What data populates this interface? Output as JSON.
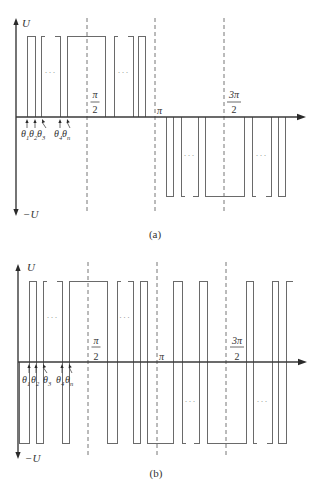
{
  "figure": {
    "panels": [
      {
        "id": "a",
        "caption": "(a)",
        "caption_pos": [
          155,
          238
        ],
        "waveform_type": "unipolar",
        "origin": {
          "x": 16,
          "y": 117
        },
        "levels": {
          "high": 36,
          "low": 196
        },
        "dots_y": {
          "high": 75,
          "low": 158
        },
        "dots_text": "···",
        "y_axis": {
          "top": 18,
          "bottom": 216,
          "pos_label": "U",
          "neg_label": "−U",
          "pos_label_pos": [
            22,
            27
          ],
          "neg_label_pos": [
            23,
            218
          ]
        },
        "x_axis": {
          "end": 306
        },
        "guides": {
          "x": [
            87,
            155,
            224
          ],
          "y_range": [
            18,
            214
          ]
        },
        "ticks": [
          {
            "kind": "fraction",
            "num": "π",
            "den": "2",
            "x": 95,
            "bar_y": 102,
            "num_y": 98,
            "den_y": 113,
            "half_width": 4.5
          },
          {
            "kind": "plain",
            "text": "π",
            "x": 157,
            "y": 114
          },
          {
            "kind": "fraction",
            "num": "3π",
            "den": "2",
            "x": 234,
            "bar_y": 102,
            "num_y": 98,
            "den_y": 113,
            "half_width": 7
          }
        ],
        "angles": {
          "label_y": 137,
          "tip_y": 119,
          "tail_y": 128,
          "items": [
            {
              "sym": "θ",
              "sub": "1",
              "x": 21,
              "tip": 27,
              "tail": 27
            },
            {
              "sym": "θ",
              "sub": "2",
              "x": 29,
              "tip": 35,
              "tail": 35
            },
            {
              "sym": "θ",
              "sub": "3",
              "x": 37,
              "tip": 42,
              "tail": 46
            },
            {
              "sym": "θ",
              "sub": "4",
              "x": 54,
              "tip": 60,
              "tail": 60
            },
            {
              "sym": "θ",
              "sub": "n",
              "x": 62,
              "tip": 67,
              "tail": 70
            }
          ]
        },
        "pulses": [
          {
            "x1": 27,
            "x2": 35,
            "dir": "up"
          },
          {
            "x1": 41,
            "x2": 60,
            "dir": "up",
            "broken": true
          },
          {
            "x1": 67,
            "x2": 105,
            "dir": "up"
          },
          {
            "x1": 114,
            "x2": 133,
            "dir": "up",
            "broken": true
          },
          {
            "x1": 138,
            "x2": 145,
            "dir": "up"
          },
          {
            "x1": 166,
            "x2": 173,
            "dir": "down"
          },
          {
            "x1": 181,
            "x2": 198,
            "dir": "down",
            "broken": true
          },
          {
            "x1": 205,
            "x2": 244,
            "dir": "down"
          },
          {
            "x1": 252,
            "x2": 271,
            "dir": "down",
            "broken": true
          },
          {
            "x1": 278,
            "x2": 285,
            "dir": "down"
          }
        ]
      },
      {
        "id": "b",
        "caption": "(b)",
        "caption_pos": [
          156,
          477
        ],
        "waveform_type": "bipolar",
        "origin": {
          "x": 18,
          "y": 362
        },
        "levels": {
          "high": 281,
          "low": 443
        },
        "dots_y": {
          "high": 320,
          "low": 404
        },
        "dots_text": "···",
        "y_axis": {
          "top": 264,
          "bottom": 459,
          "pos_label": "U",
          "neg_label": "−U",
          "pos_label_pos": [
            27,
            271
          ],
          "neg_label_pos": [
            25,
            462
          ]
        },
        "x_axis": {
          "end": 307
        },
        "guides": {
          "x": [
            88,
            157,
            226
          ],
          "y_range": [
            262,
            457
          ]
        },
        "ticks": [
          {
            "kind": "fraction",
            "num": "π",
            "den": "2",
            "x": 96,
            "bar_y": 347,
            "num_y": 344,
            "den_y": 360,
            "half_width": 4.5
          },
          {
            "kind": "plain",
            "text": "π",
            "x": 159,
            "y": 360
          },
          {
            "kind": "fraction",
            "num": "3π",
            "den": "2",
            "x": 237,
            "bar_y": 347,
            "num_y": 344,
            "den_y": 360,
            "half_width": 7
          }
        ],
        "angles": {
          "label_y": 383,
          "tip_y": 364,
          "tail_y": 373,
          "items": [
            {
              "sym": "θ",
              "sub": "1",
              "x": 22,
              "tip": 29,
              "tail": 29
            },
            {
              "sym": "θ",
              "sub": "2",
              "x": 31,
              "tip": 36,
              "tail": 36
            },
            {
              "sym": "θ",
              "sub": "3",
              "x": 43,
              "tip": 43,
              "tail": 47
            },
            {
              "sym": "θ",
              "sub": "4",
              "x": 56,
              "tip": 62,
              "tail": 62
            },
            {
              "sym": "θ",
              "sub": "n",
              "x": 65,
              "tip": 69,
              "tail": 72
            }
          ]
        },
        "segments": [
          {
            "x1": 19,
            "x2": 29,
            "level": "low"
          },
          {
            "x1": 29,
            "x2": 36,
            "level": "high"
          },
          {
            "x1": 36,
            "x2": 43,
            "level": "low"
          },
          {
            "x1": 43,
            "x2": 62,
            "level": "high",
            "broken": true
          },
          {
            "x1": 62,
            "x2": 69,
            "level": "low"
          },
          {
            "x1": 69,
            "x2": 107,
            "level": "high"
          },
          {
            "x1": 107,
            "x2": 117,
            "level": "low"
          },
          {
            "x1": 117,
            "x2": 133,
            "level": "high",
            "broken": true
          },
          {
            "x1": 133,
            "x2": 140,
            "level": "low"
          },
          {
            "x1": 140,
            "x2": 147,
            "level": "high"
          },
          {
            "x1": 147,
            "x2": 173,
            "level": "low"
          },
          {
            "x1": 173,
            "x2": 182,
            "level": "high"
          },
          {
            "x1": 182,
            "x2": 199,
            "level": "low",
            "broken": true
          },
          {
            "x1": 199,
            "x2": 207,
            "level": "high"
          },
          {
            "x1": 207,
            "x2": 246,
            "level": "low"
          },
          {
            "x1": 246,
            "x2": 253,
            "level": "high"
          },
          {
            "x1": 253,
            "x2": 272,
            "level": "low",
            "broken": true
          },
          {
            "x1": 272,
            "x2": 278,
            "level": "high"
          },
          {
            "x1": 278,
            "x2": 286,
            "level": "low"
          },
          {
            "x1": 286,
            "x2": 293,
            "level": "high"
          }
        ]
      }
    ]
  }
}
